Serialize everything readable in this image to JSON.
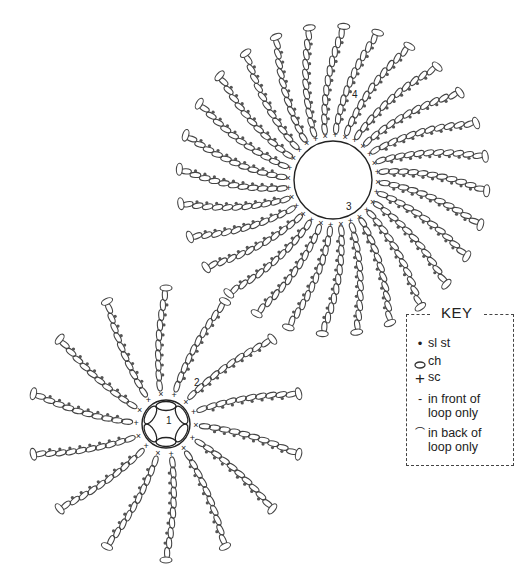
{
  "diagram": {
    "stroke_color": "#444444",
    "dot_color": "#555555",
    "motifs": [
      {
        "name": "large-motif",
        "center": [
          333,
          180
        ],
        "ring_radius": 39,
        "petal_count": 28,
        "petal_inner": 47,
        "petal_outer": 152,
        "chain_count": 11,
        "curl_deg": 14,
        "round_labels": [
          {
            "text": "3",
            "x": 346,
            "y": 210
          },
          {
            "text": "4",
            "x": 352,
            "y": 98
          }
        ]
      },
      {
        "name": "small-motif",
        "center": [
          166,
          424
        ],
        "ring_radius": 24,
        "petal_count": 14,
        "petal_inner": 34,
        "petal_outer": 134,
        "chain_count": 10,
        "curl_deg": 10,
        "round_labels": [
          {
            "text": "1",
            "x": 166,
            "y": 424
          },
          {
            "text": "2",
            "x": 194,
            "y": 386
          }
        ]
      }
    ]
  },
  "key": {
    "title": "KEY",
    "items": [
      {
        "symbol": "•",
        "symbol_name": "slip-stitch-dot",
        "label": "sl st"
      },
      {
        "symbol": "⬭",
        "symbol_name": "chain-oval",
        "label": "ch"
      },
      {
        "symbol": "+",
        "symbol_name": "single-crochet-cross",
        "label": "sc"
      },
      {
        "symbol": "‐",
        "symbol_name": "front-loop-dash",
        "label": "in front of",
        "label2": "loop only"
      },
      {
        "symbol": "⌒",
        "symbol_name": "back-loop-arc",
        "label": "in back of",
        "label2": "loop only"
      }
    ]
  }
}
